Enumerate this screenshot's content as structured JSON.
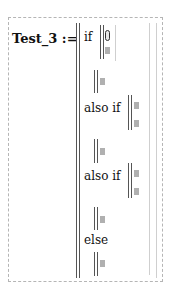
{
  "definition": {
    "name_label": "Test_3 :=",
    "if_label": "if",
    "if_condition_value": "0",
    "also_if_labels": [
      "also if",
      "also if"
    ],
    "else_label": "else"
  },
  "colors": {
    "region_border": "#b5b5b5",
    "bar": "#555555",
    "placeholder": "#b0b0b0"
  }
}
